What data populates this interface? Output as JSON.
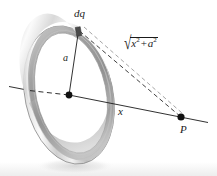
{
  "figure": {
    "caption_id": "charged-ring-axial-field",
    "background_color": "#ffffff",
    "ink_color": "#1a1a1a",
    "ring": {
      "highlight_color": "#fdfdfd",
      "midtone_color": "#d9d9d9",
      "shadow_color": "#9a9a9a",
      "outline_color": "#8c8c8c",
      "radius_label": "a"
    },
    "floor_band_color": "#ededed",
    "labels": {
      "charge_element": "dq",
      "radius": "a",
      "axial_distance": "x",
      "field_point": "P",
      "distance_expression": {
        "radical_sign": "√",
        "term1_base": "x",
        "term1_exponent": "2",
        "operator": "+",
        "term2_base": "a",
        "term2_exponent": "2",
        "plain": "√(x² + a²)"
      }
    },
    "points": {
      "center": {
        "x": 69,
        "y": 95,
        "name": "ring-center"
      },
      "charge_element": {
        "x": 78.5,
        "y": 31,
        "name": "dq-point"
      },
      "field_point": {
        "x": 181,
        "y": 117,
        "name": "point-p"
      }
    }
  }
}
